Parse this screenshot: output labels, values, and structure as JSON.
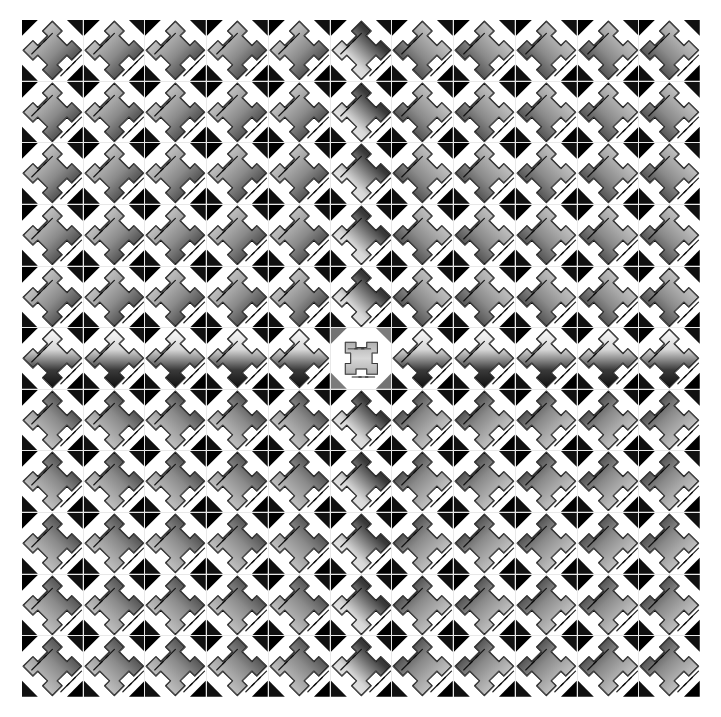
{
  "image": {
    "title": "Metallic cross-tile mosaic",
    "kind": "seamless-tiled-texture",
    "width": 721,
    "height": 717,
    "background_color": "#ffffff"
  },
  "grid": {
    "columns": 11,
    "rows": 11,
    "tile_count": 121,
    "offset_x": 22,
    "offset_y": 20,
    "grid_width": 678,
    "grid_height": 677,
    "tile_size": 61.6,
    "gutter_color": "#e8e8e8",
    "gutter_width": 1,
    "symmetry": "four-quadrant mirror about center row 6 and center column 6"
  },
  "motif": {
    "name": "beveled-cross",
    "description": "Rounded X / plus-shaped metallic plate with chamfered arms, set on a white background, bearing three short parallel incised diagonal grooves on opposite arms.",
    "center_variant": "diamond-rotated-cross",
    "groove_count": 3,
    "groove_color": "#0a0a0a",
    "edge_highlight_color": "#f2f2f2",
    "shadow_color": "#050505"
  },
  "palette": {
    "highlight": "#fbfbfb",
    "light_metal": "#d7d7d7",
    "mid_metal": "#8a8a8a",
    "dark_metal": "#3a3a3a",
    "deep_shadow": "#111111",
    "black": "#000000",
    "white": "#ffffff",
    "gutter": "#e8e8e8"
  },
  "gradient_map": {
    "quadrant_top_left": "linear 135deg, light top-left to dark bottom-right",
    "quadrant_top_right": "linear 225deg, light top-right to dark bottom-left",
    "quadrant_bottom_left": "linear 45deg, light bottom-left to dark top-right",
    "quadrant_bottom_right": "linear 315deg, light bottom-right to dark top-left",
    "center_row": "inverted vertical, dark top to light bottom",
    "center_column": "inverted horizontal",
    "center_tile": "radial, mid-grey diamond plates"
  },
  "chart_data": {
    "type": "heatmap",
    "xlabel": "",
    "ylabel": "",
    "grid": true,
    "legend": "none",
    "categories": [
      "c1",
      "c2",
      "c3",
      "c4",
      "c5",
      "c6",
      "c7",
      "c8",
      "c9",
      "c10",
      "c11"
    ],
    "rows": [
      "r1",
      "r2",
      "r3",
      "r4",
      "r5",
      "r6",
      "r7",
      "r8",
      "r9",
      "r10",
      "r11"
    ],
    "note": "Each cell holds one beveled-cross tile. Values encode the mean luminance (0-255) sampled at the centre of each tile.",
    "values": [
      [
        96,
        98,
        99,
        101,
        104,
        150,
        86,
        84,
        83,
        82,
        80
      ],
      [
        95,
        97,
        98,
        100,
        103,
        148,
        85,
        83,
        82,
        81,
        79
      ],
      [
        94,
        96,
        97,
        99,
        102,
        146,
        84,
        82,
        81,
        80,
        78
      ],
      [
        93,
        95,
        96,
        98,
        101,
        144,
        83,
        81,
        80,
        79,
        77
      ],
      [
        92,
        94,
        95,
        97,
        100,
        142,
        82,
        80,
        79,
        78,
        76
      ],
      [
        138,
        140,
        141,
        143,
        146,
        132,
        128,
        126,
        125,
        124,
        122
      ],
      [
        92,
        94,
        95,
        97,
        100,
        142,
        82,
        80,
        79,
        78,
        76
      ],
      [
        93,
        95,
        96,
        98,
        101,
        144,
        83,
        81,
        80,
        79,
        77
      ],
      [
        94,
        96,
        97,
        99,
        102,
        146,
        84,
        82,
        81,
        80,
        78
      ],
      [
        95,
        97,
        98,
        100,
        103,
        148,
        85,
        83,
        82,
        81,
        79
      ],
      [
        96,
        98,
        99,
        101,
        104,
        150,
        86,
        84,
        83,
        82,
        80
      ]
    ]
  }
}
